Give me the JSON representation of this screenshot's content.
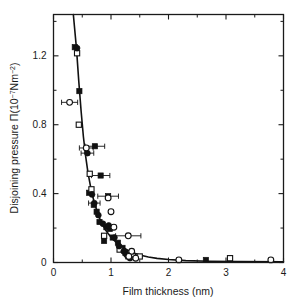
{
  "chart_data": {
    "type": "scatter",
    "title": "",
    "xlabel": "Film thickness (nm)",
    "ylabel_parts": {
      "main": "Disjoining pressure ",
      "symbol": "Π",
      "unit_open": "(10",
      "unit_exp1": "−7",
      "unit_mid": "Nm",
      "unit_exp2": "−2",
      "unit_close": ")"
    },
    "ylabel": "Disjoining pressure Π(10−7Nm−2)",
    "xlim": [
      0,
      4
    ],
    "ylim": [
      0,
      1.44
    ],
    "xticks": [
      0,
      1,
      2,
      3,
      4
    ],
    "xtick_labels": [
      "0",
      "1",
      "2",
      "3",
      "4"
    ],
    "yticks": [
      0,
      0.4,
      0.8,
      1.2
    ],
    "ytick_labels": [
      "0",
      "0.4",
      "0.8",
      "1.2"
    ],
    "x_minor_ticks": [
      0.5,
      1.5,
      2.5,
      3.5
    ],
    "y_minor_ticks": [
      0.2,
      0.6,
      1.0,
      1.4
    ],
    "grid": false,
    "legend": false,
    "frame": true,
    "axis_color": "#1a1a1a",
    "series": [
      {
        "name": "filled-squares",
        "marker": "filled-square",
        "color": "#111111",
        "points": [
          {
            "x": 0.37,
            "y": 1.25
          },
          {
            "x": 0.45,
            "y": 0.995
          },
          {
            "x": 0.72,
            "y": 0.675,
            "xerr": 0.17
          },
          {
            "x": 0.82,
            "y": 0.505,
            "xerr": 0.16
          },
          {
            "x": 0.62,
            "y": 0.405
          },
          {
            "x": 0.95,
            "y": 0.385,
            "xerr": 0.18
          },
          {
            "x": 0.7,
            "y": 0.335
          },
          {
            "x": 0.75,
            "y": 0.295
          },
          {
            "x": 0.8,
            "y": 0.235
          },
          {
            "x": 0.92,
            "y": 0.205
          },
          {
            "x": 0.98,
            "y": 0.195
          },
          {
            "x": 0.88,
            "y": 0.125
          },
          {
            "x": 1.03,
            "y": 0.145
          },
          {
            "x": 1.12,
            "y": 0.115
          },
          {
            "x": 1.2,
            "y": 0.085
          },
          {
            "x": 1.25,
            "y": 0.055
          },
          {
            "x": 1.3,
            "y": 0.035
          },
          {
            "x": 2.65,
            "y": 0.015
          }
        ]
      },
      {
        "name": "open-squares",
        "marker": "open-square",
        "color": "#111111",
        "points": [
          {
            "x": 0.41,
            "y": 1.215
          },
          {
            "x": 0.44,
            "y": 0.8
          },
          {
            "x": 0.63,
            "y": 0.515
          },
          {
            "x": 0.66,
            "y": 0.425
          },
          {
            "x": 0.88,
            "y": 0.155
          },
          {
            "x": 1.15,
            "y": 0.075
          },
          {
            "x": 1.38,
            "y": 0.035
          },
          {
            "x": 1.5,
            "y": 0.035
          },
          {
            "x": 3.07,
            "y": 0.025
          }
        ]
      },
      {
        "name": "filled-circles",
        "marker": "filled-circle",
        "color": "#111111",
        "points": [
          {
            "x": 0.41,
            "y": 1.245
          },
          {
            "x": 0.59,
            "y": 0.635,
            "xerr": 0.11
          },
          {
            "x": 0.67,
            "y": 0.395
          },
          {
            "x": 0.71,
            "y": 0.345,
            "xerr": 0.1
          },
          {
            "x": 0.78,
            "y": 0.275
          },
          {
            "x": 0.86,
            "y": 0.225
          },
          {
            "x": 0.96,
            "y": 0.215
          },
          {
            "x": 1.06,
            "y": 0.145
          },
          {
            "x": 1.14,
            "y": 0.095
          },
          {
            "x": 1.22,
            "y": 0.065
          },
          {
            "x": 1.27,
            "y": 0.045
          },
          {
            "x": 1.33,
            "y": 0.025
          }
        ]
      },
      {
        "name": "open-circles",
        "marker": "open-circle",
        "color": "#111111",
        "points": [
          {
            "x": 0.28,
            "y": 0.93,
            "xerr": 0.14
          },
          {
            "x": 0.57,
            "y": 0.665,
            "xerr": 0.12
          },
          {
            "x": 0.95,
            "y": 0.375
          },
          {
            "x": 1.0,
            "y": 0.295
          },
          {
            "x": 1.05,
            "y": 0.205
          },
          {
            "x": 1.3,
            "y": 0.155,
            "xerr": 0.22
          },
          {
            "x": 1.36,
            "y": 0.065
          },
          {
            "x": 1.31,
            "y": 0.035
          },
          {
            "x": 1.43,
            "y": 0.025
          },
          {
            "x": 2.18,
            "y": 0.015
          },
          {
            "x": 3.78,
            "y": 0.015
          }
        ]
      }
    ],
    "fit_curve": {
      "name": "fit-line",
      "color": "#111111",
      "width": 1.6,
      "points": [
        {
          "x": 0.345,
          "y": 1.44
        },
        {
          "x": 0.4,
          "y": 1.24
        },
        {
          "x": 0.44,
          "y": 1.05
        },
        {
          "x": 0.48,
          "y": 0.88
        },
        {
          "x": 0.52,
          "y": 0.73
        },
        {
          "x": 0.56,
          "y": 0.615
        },
        {
          "x": 0.6,
          "y": 0.52
        },
        {
          "x": 0.65,
          "y": 0.43
        },
        {
          "x": 0.7,
          "y": 0.36
        },
        {
          "x": 0.75,
          "y": 0.305
        },
        {
          "x": 0.8,
          "y": 0.258
        },
        {
          "x": 0.85,
          "y": 0.222
        },
        {
          "x": 0.9,
          "y": 0.192
        },
        {
          "x": 0.95,
          "y": 0.168
        },
        {
          "x": 1.0,
          "y": 0.147
        },
        {
          "x": 1.1,
          "y": 0.114
        },
        {
          "x": 1.2,
          "y": 0.089
        },
        {
          "x": 1.3,
          "y": 0.07
        },
        {
          "x": 1.4,
          "y": 0.055
        },
        {
          "x": 1.5,
          "y": 0.044
        },
        {
          "x": 1.65,
          "y": 0.032
        },
        {
          "x": 1.8,
          "y": 0.024
        },
        {
          "x": 2.0,
          "y": 0.017
        },
        {
          "x": 2.3,
          "y": 0.011
        },
        {
          "x": 2.7,
          "y": 0.007
        },
        {
          "x": 3.2,
          "y": 0.005
        },
        {
          "x": 4.0,
          "y": 0.004
        }
      ]
    }
  }
}
